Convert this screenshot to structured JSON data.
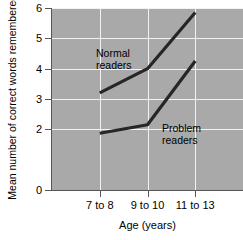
{
  "chart_data": {
    "type": "line",
    "title": "",
    "xlabel": "Age (years)",
    "ylabel": "Mean number of correct\nwords remembered",
    "categories": [
      "7 to 8",
      "9 to 10",
      "11 to 13"
    ],
    "series": [
      {
        "name": "Normal readers",
        "values": [
          3.2,
          4.0,
          5.85
        ]
      },
      {
        "name": "Problem readers",
        "values": [
          1.87,
          2.15,
          4.25
        ]
      }
    ],
    "ylim": [
      0,
      6
    ],
    "yticks": [
      0,
      2,
      3,
      4,
      5,
      6
    ],
    "ytick_labels": [
      "0",
      "2",
      "3",
      "4",
      "5",
      "6"
    ],
    "gridlines": [
      2,
      3,
      4,
      5,
      6
    ],
    "grid": true,
    "legend": "in-plot annotations",
    "annotations": [
      {
        "label": "Normal\nreaders",
        "series": "Normal readers"
      },
      {
        "label": "Problem\nreaders",
        "series": "Problem readers"
      }
    ],
    "plot_background_color": "#a9a9a9",
    "gridline_color": "#f2f2f2",
    "line_color": "#262626"
  },
  "axes": {
    "y_title": "Mean number of correct\nwords remembered",
    "x_title": "Age (years)"
  }
}
